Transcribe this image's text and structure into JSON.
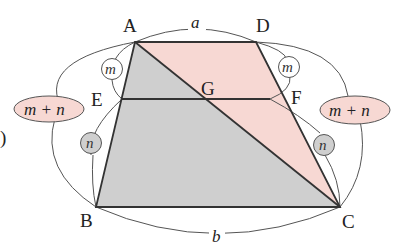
{
  "diagram": {
    "colors": {
      "pink_fill": "#f7d8d3",
      "gray_fill": "#cfcfcf",
      "edge": "#333333",
      "arc": "#555555",
      "ellipse_fill": "#f7d8d3",
      "circle_m_fill": "#ffffff",
      "circle_n_fill": "#cfcfcf"
    },
    "vertices": {
      "A": {
        "label": "A",
        "x": 135,
        "y": 42
      },
      "D": {
        "label": "D",
        "x": 256,
        "y": 42
      },
      "B": {
        "label": "B",
        "x": 96,
        "y": 207
      },
      "C": {
        "label": "C",
        "x": 340,
        "y": 207
      },
      "E": {
        "label": "E",
        "x": 122,
        "y": 99
      },
      "F": {
        "label": "F",
        "x": 270,
        "y": 99
      },
      "G": {
        "label": "G",
        "x": 205,
        "y": 99
      }
    },
    "lengths": {
      "top": "a",
      "bottom": "b"
    },
    "ratio_labels": {
      "left_upper": "m",
      "left_lower": "n",
      "right_upper": "m",
      "right_lower": "n",
      "left_total": "m + n",
      "right_total": "m + n"
    },
    "edge_mark": ")"
  }
}
